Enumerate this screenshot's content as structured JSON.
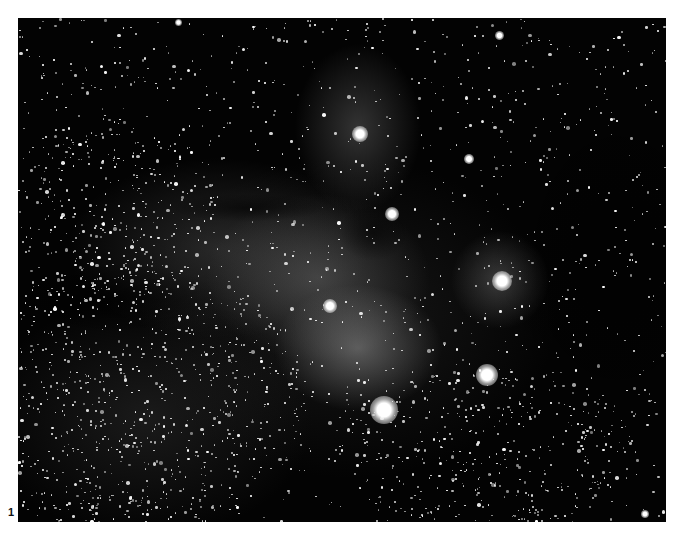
{
  "figure": {
    "label": "1"
  },
  "photo": {
    "background_color": "#030303",
    "star_color": "#ffffff",
    "star_field": {
      "seed": 17,
      "count": 1400,
      "dense_regions": [
        {
          "x": 110,
          "y": 380,
          "rx": 180,
          "ry": 140,
          "count": 700
        },
        {
          "x": 90,
          "y": 190,
          "rx": 110,
          "ry": 90,
          "count": 250
        },
        {
          "x": 470,
          "y": 430,
          "rx": 150,
          "ry": 80,
          "count": 300
        }
      ]
    },
    "bright_stars": [
      {
        "name": "antares",
        "x": 366,
        "y": 392,
        "size": 28
      },
      {
        "name": "sigma-sco",
        "x": 469,
        "y": 357,
        "size": 22
      },
      {
        "name": "ic4603-star",
        "x": 484,
        "y": 263,
        "size": 20
      },
      {
        "name": "rho-oph",
        "x": 342,
        "y": 116,
        "size": 16
      },
      {
        "name": "upper-reflection-star",
        "x": 374,
        "y": 196,
        "size": 14
      },
      {
        "name": "mid-nebula-star",
        "x": 312,
        "y": 288,
        "size": 14
      },
      {
        "name": "upper-right-star",
        "x": 451,
        "y": 141,
        "size": 10
      },
      {
        "name": "top-star",
        "x": 481,
        "y": 17,
        "size": 9
      },
      {
        "name": "top-left-star",
        "x": 160,
        "y": 4,
        "size": 7
      },
      {
        "name": "bottom-right-star",
        "x": 627,
        "y": 496,
        "size": 8
      }
    ]
  }
}
